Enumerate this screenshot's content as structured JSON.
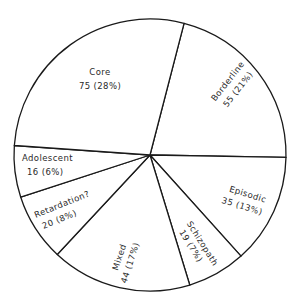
{
  "chart_data": {
    "type": "pie",
    "title": "",
    "total": 268,
    "start_angle_deg": 14.5,
    "direction": "clockwise",
    "grid": false,
    "legend": "none (labels inside slices)",
    "colors": {
      "fill": "#ffffff",
      "stroke": "#1a1a1a",
      "text": "#2a2a2a"
    },
    "slices": [
      {
        "label": "Borderline",
        "value": 55,
        "percent": "21%",
        "display": "55 (21%)",
        "end_angle_deg": 91
      },
      {
        "label": "Episodic",
        "value": 35,
        "percent": "13%",
        "display": "35 (13%)",
        "end_angle_deg": 138
      },
      {
        "label": "Schizopath",
        "value": 19,
        "percent": "7%",
        "display": "19 (7%)",
        "end_angle_deg": 163
      },
      {
        "label": "Mixed",
        "value": 44,
        "percent": "17%",
        "display": "44 (17%)",
        "end_angle_deg": 223
      },
      {
        "label": "Retardation?",
        "value": 20,
        "percent": "8%",
        "display": "20 (8%)",
        "end_angle_deg": 252
      },
      {
        "label": "Adolescent",
        "value": 16,
        "percent": "6%",
        "display": "16 (6%)",
        "end_angle_deg": 274
      },
      {
        "label": "Core",
        "value": 75,
        "percent": "28%",
        "display": "75 (28%)",
        "end_angle_deg": 374.5
      }
    ]
  }
}
